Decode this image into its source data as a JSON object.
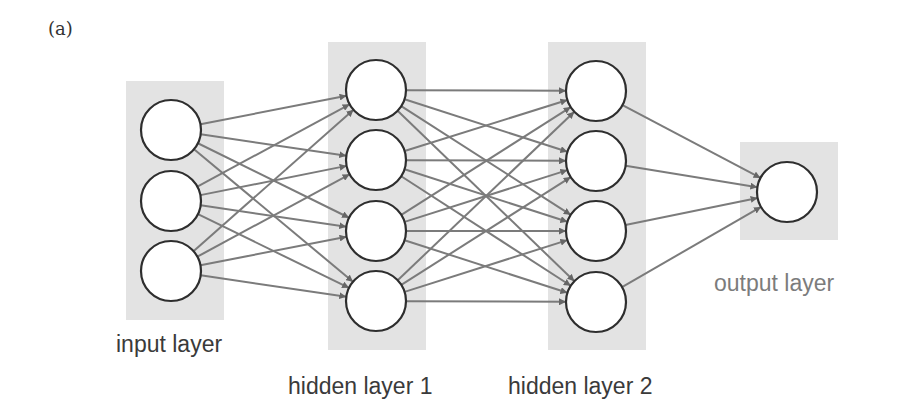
{
  "figure": {
    "panel_label": "(a)"
  },
  "colors": {
    "panel_fill": "#e3e3e3",
    "node_fill": "#ffffff",
    "node_stroke": "#2e2e2e",
    "edge": "#7b7b7b",
    "arrowhead": "#666666"
  },
  "layers": [
    {
      "id": "input",
      "label": "input layer",
      "panel": {
        "x": 126,
        "y": 81,
        "w": 98,
        "h": 239
      },
      "nodes": [
        {
          "cx": 171,
          "cy": 130
        },
        {
          "cx": 171,
          "cy": 201
        },
        {
          "cx": 171,
          "cy": 271
        }
      ],
      "label_pos": {
        "x": 116,
        "y": 331
      },
      "label_style": "dark"
    },
    {
      "id": "hidden1",
      "label": "hidden layer 1",
      "panel": {
        "x": 328,
        "y": 42,
        "w": 98,
        "h": 308
      },
      "nodes": [
        {
          "cx": 376,
          "cy": 90
        },
        {
          "cx": 376,
          "cy": 160
        },
        {
          "cx": 376,
          "cy": 231
        },
        {
          "cx": 376,
          "cy": 301
        }
      ],
      "label_pos": {
        "x": 288,
        "y": 373
      },
      "label_style": "dark"
    },
    {
      "id": "hidden2",
      "label": "hidden layer 2",
      "panel": {
        "x": 548,
        "y": 42,
        "w": 98,
        "h": 308
      },
      "nodes": [
        {
          "cx": 596,
          "cy": 91
        },
        {
          "cx": 596,
          "cy": 161
        },
        {
          "cx": 596,
          "cy": 231
        },
        {
          "cx": 596,
          "cy": 302
        }
      ],
      "label_pos": {
        "x": 508,
        "y": 373
      },
      "label_style": "dark"
    },
    {
      "id": "output",
      "label": "output layer",
      "panel": {
        "x": 740,
        "y": 142,
        "w": 98,
        "h": 98
      },
      "nodes": [
        {
          "cx": 787,
          "cy": 192
        }
      ],
      "label_pos": {
        "x": 714,
        "y": 270
      },
      "label_style": "light"
    }
  ],
  "node_radius": 30,
  "connections": "fully-connected between consecutive layers"
}
